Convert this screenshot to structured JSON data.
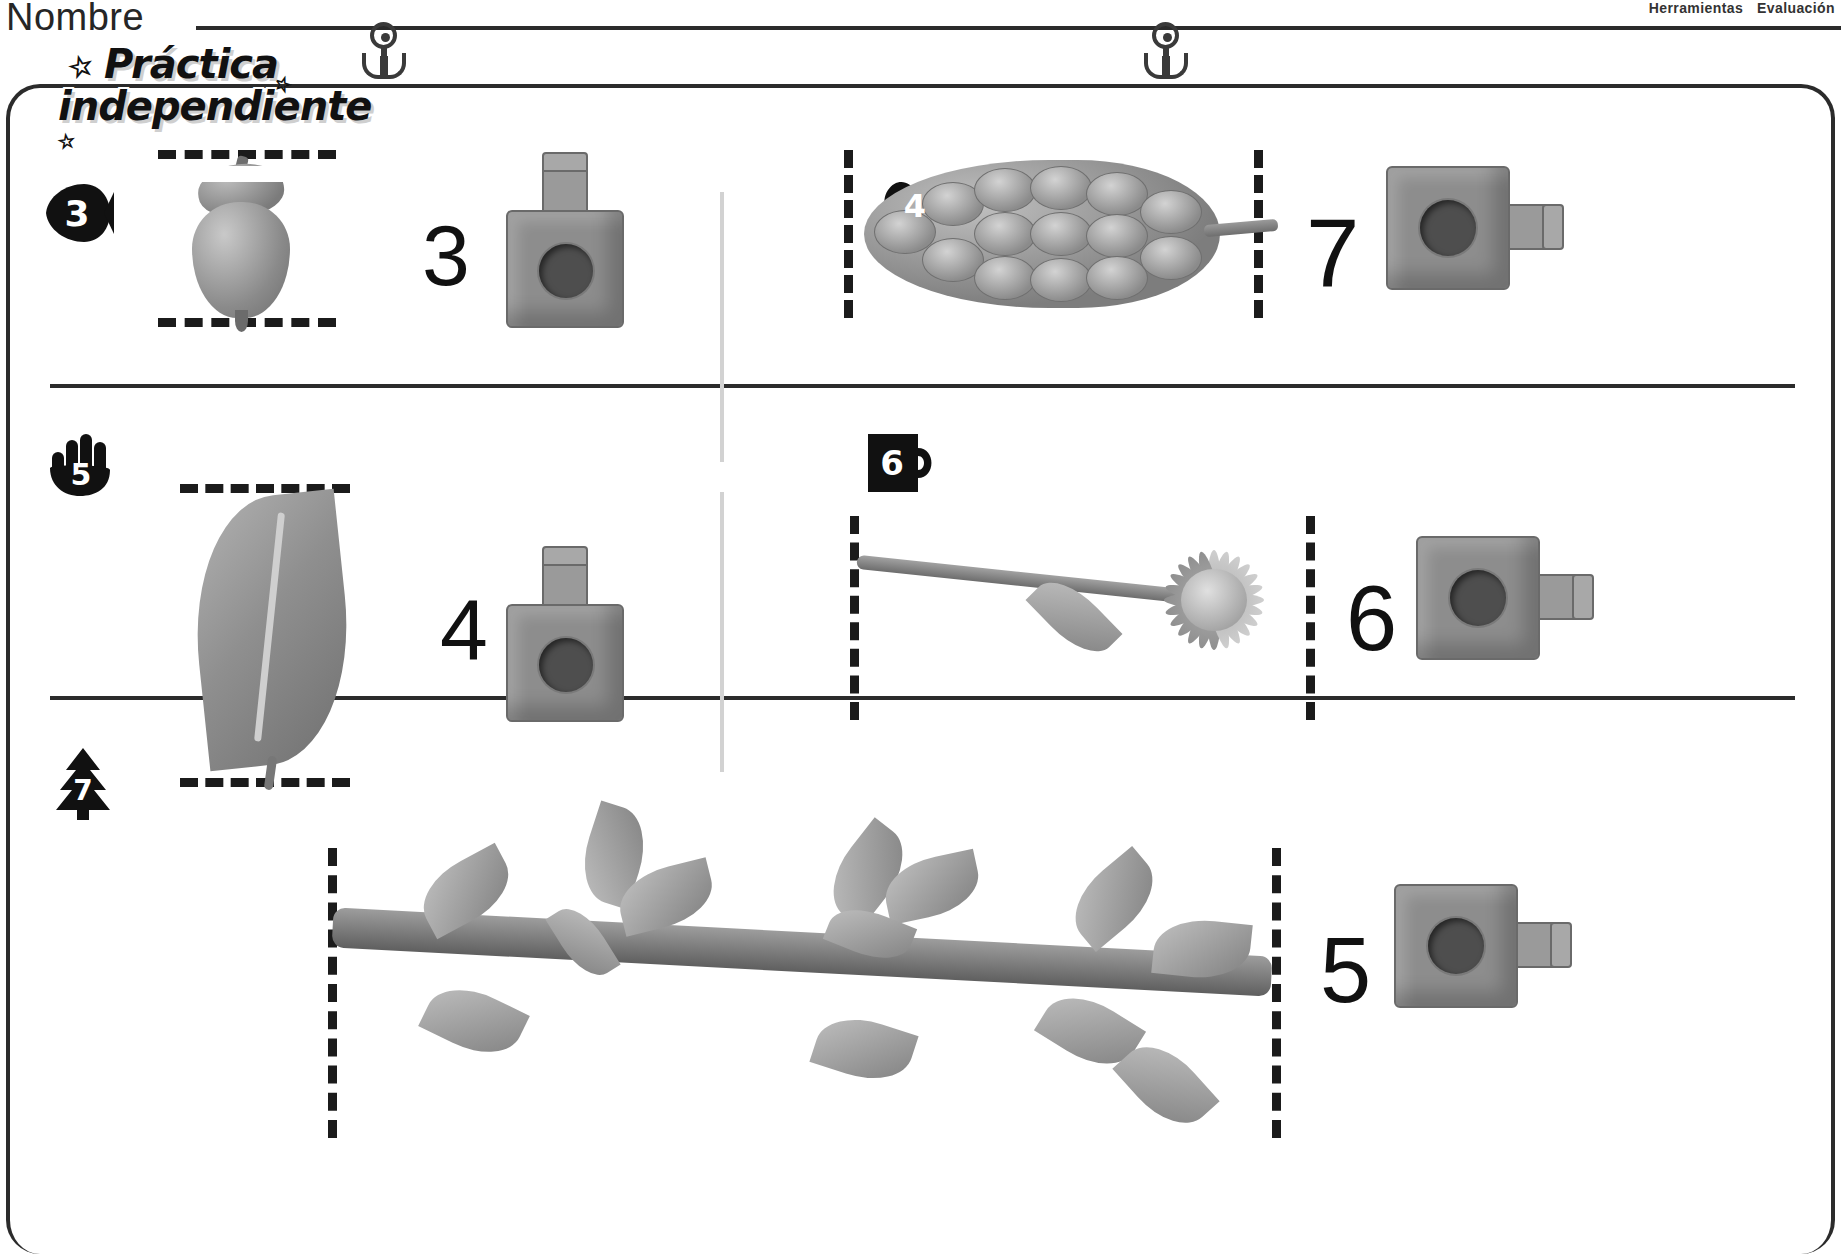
{
  "header": {
    "name_label": "Nombre",
    "meta": [
      "Herramientas",
      "Evaluación"
    ]
  },
  "banner": {
    "line1": "Práctica",
    "line2": "independiente",
    "star_glyph": "☆"
  },
  "worksheet": {
    "problems": [
      {
        "number": "3",
        "badge_icon": "fish-badge",
        "object": "acorn",
        "answer": "3",
        "cube_orientation": "vertical",
        "dash_guides": "horizontal-top-bottom"
      },
      {
        "number": "4",
        "badge_icon": "heart-badge",
        "object": "pinecone",
        "answer": "7",
        "cube_orientation": "horizontal",
        "dash_guides": "vertical-left-right"
      },
      {
        "number": "5",
        "badge_icon": "hand-badge",
        "object": "leaf",
        "answer": "4",
        "cube_orientation": "vertical",
        "dash_guides": "horizontal-top-bottom"
      },
      {
        "number": "6",
        "badge_icon": "mug-badge",
        "object": "flower",
        "answer": "6",
        "cube_orientation": "horizontal",
        "dash_guides": "vertical-left-right"
      },
      {
        "number": "7",
        "badge_icon": "tree-badge",
        "object": "leafy-branch",
        "answer": "5",
        "cube_orientation": "horizontal",
        "dash_guides": "vertical-left-right"
      }
    ]
  },
  "colors": {
    "ink": "#1a1a1a",
    "rule": "#2b2b2b",
    "cube_face": "#8d8d8d",
    "cube_hole": "#4e4e4e",
    "divider_light": "#d2d2d2"
  }
}
